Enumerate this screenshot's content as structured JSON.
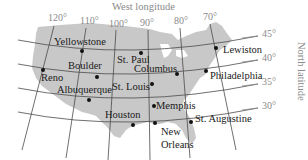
{
  "colors": {
    "land": "#c8c8c8",
    "grid": "#4a4a4a",
    "axis_text": "#8a8a8a",
    "city_text": "#1a1a1a",
    "dot": "#111111",
    "background": "#ffffff"
  },
  "map": {
    "title_top": "West longitude",
    "title_right": "North latitude",
    "longitudes": [
      {
        "label": "120°",
        "x": 50,
        "y": 13
      },
      {
        "label": "110°",
        "x": 81,
        "y": 16
      },
      {
        "label": "100°",
        "x": 110,
        "y": 19
      },
      {
        "label": "90°",
        "x": 141,
        "y": 18
      },
      {
        "label": "80°",
        "x": 177,
        "y": 16
      },
      {
        "label": "70°",
        "x": 205,
        "y": 12
      }
    ],
    "latitudes": [
      {
        "label": "45°",
        "x": 261,
        "y": 34
      },
      {
        "label": "40°",
        "x": 261,
        "y": 58
      },
      {
        "label": "35°",
        "x": 261,
        "y": 82
      },
      {
        "label": "30°",
        "x": 261,
        "y": 106
      }
    ],
    "cities": [
      {
        "name": "Yellowstone",
        "dot": [
          82,
          51
        ],
        "label": [
          53,
          36
        ]
      },
      {
        "name": "St. Paul",
        "dot": [
          141,
          53
        ],
        "label": [
          117,
          56
        ]
      },
      {
        "name": "Lewiston",
        "dot": [
          216,
          48
        ],
        "label": [
          224,
          44
        ]
      },
      {
        "name": "Boulder",
        "dot": [
          97,
          77
        ],
        "label": [
          68,
          60
        ]
      },
      {
        "name": "Columbus",
        "dot": [
          177,
          74
        ],
        "label": [
          133,
          63
        ]
      },
      {
        "name": "Philadelphia",
        "dot": [
          206,
          71
        ],
        "label": [
          212,
          70
        ]
      },
      {
        "name": "Reno",
        "dot": [
          43,
          70
        ],
        "label": [
          40,
          73
        ]
      },
      {
        "name": "Albuquerque",
        "dot": [
          89,
          100
        ],
        "label": [
          57,
          84
        ]
      },
      {
        "name": "St. Louis",
        "dot": [
          152,
          84
        ],
        "label": [
          112,
          83
        ]
      },
      {
        "name": "Memphis",
        "dot": [
          154,
          106
        ],
        "label": [
          157,
          101
        ]
      },
      {
        "name": "Houston",
        "dot": [
          133,
          125
        ],
        "label": [
          104,
          110
        ]
      },
      {
        "name": "New Orleans",
        "dot": [
          155,
          123
        ],
        "label": [
          162,
          128
        ]
      },
      {
        "name": "St. Augustine",
        "dot": [
          191,
          122
        ],
        "label": [
          197,
          113
        ]
      }
    ]
  }
}
